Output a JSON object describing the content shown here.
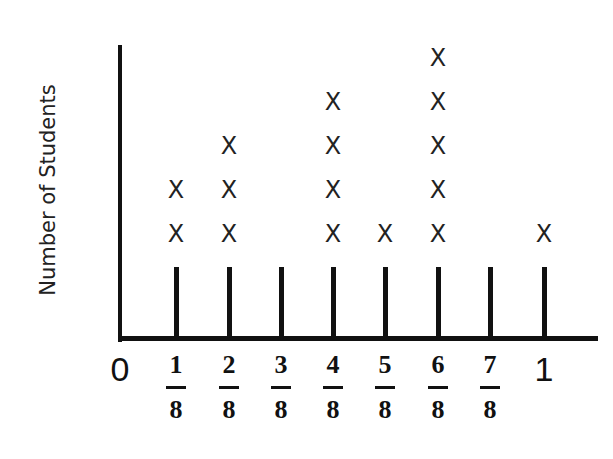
{
  "chart_data": {
    "type": "dot_plot",
    "title": "",
    "xlabel": "",
    "ylabel": "Number of Students",
    "categories": [
      "0",
      "1/8",
      "2/8",
      "3/8",
      "4/8",
      "5/8",
      "6/8",
      "7/8",
      "1"
    ],
    "values": [
      0,
      2,
      3,
      0,
      4,
      1,
      5,
      0,
      1
    ],
    "marker": "X",
    "grid": false
  },
  "axis": {
    "ylabel": "Number of Students",
    "zero_label": "0",
    "one_label": "1",
    "fractions": [
      {
        "num": "1",
        "den": "8"
      },
      {
        "num": "2",
        "den": "8"
      },
      {
        "num": "3",
        "den": "8"
      },
      {
        "num": "4",
        "den": "8"
      },
      {
        "num": "5",
        "den": "8"
      },
      {
        "num": "6",
        "den": "8"
      },
      {
        "num": "7",
        "den": "8"
      }
    ]
  },
  "marker_glyph": "X"
}
